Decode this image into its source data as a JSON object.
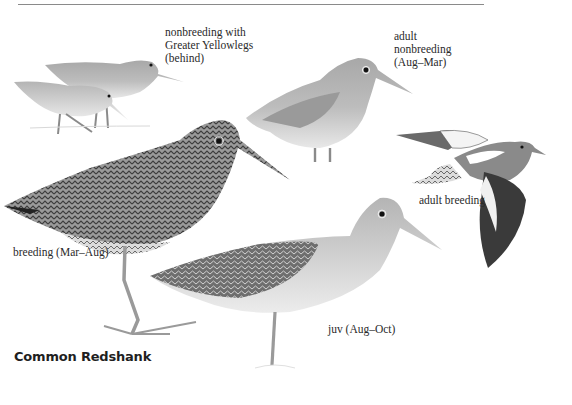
{
  "page": {
    "species_title": "Common Redshank",
    "palette": {
      "background": "#ffffff",
      "rule": "#8a8a8a",
      "text": "#2a2a2a",
      "plumage_dark": "#3a3a3a",
      "plumage_mid": "#8c8c8c",
      "plumage_light": "#c8c8c8",
      "underparts": "#e6e6e6"
    }
  },
  "plates": [
    {
      "id": "nonbreeding-with-yellowlegs",
      "label": "nonbreeding with\nGreater Yellowlegs\n(behind)"
    },
    {
      "id": "adult-nonbreeding",
      "label": "adult\nnonbreeding\n(Aug–Mar)"
    },
    {
      "id": "adult-breeding-flight",
      "label": "adult breeding"
    },
    {
      "id": "breeding",
      "label": "breeding (Mar–Aug)"
    },
    {
      "id": "juvenile",
      "label": "juv (Aug–Oct)"
    }
  ]
}
